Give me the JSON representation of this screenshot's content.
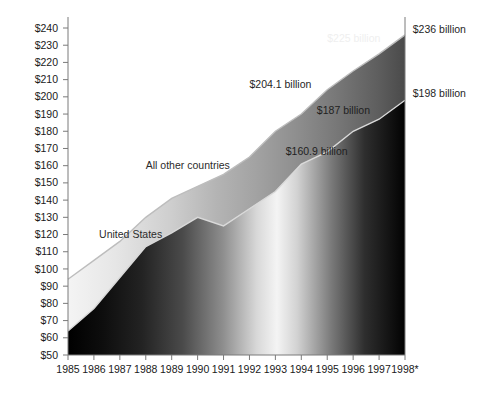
{
  "chart_data": {
    "type": "area",
    "title": "",
    "subtitle": "",
    "xlabel": "",
    "ylabel": "",
    "stacked": true,
    "grid": false,
    "legend_position": "inline-annotation",
    "x": [
      1985,
      1986,
      1987,
      1988,
      1989,
      1990,
      1991,
      1992,
      1993,
      1994,
      1995,
      1996,
      1997,
      1998
    ],
    "categories": [
      "1985",
      "1986",
      "1987",
      "1988",
      "1989",
      "1990",
      "1991",
      "1992",
      "1993",
      "1994",
      "1995",
      "1996",
      "1997",
      "1998*"
    ],
    "xlim": [
      1985,
      1998
    ],
    "ylim": [
      50,
      240
    ],
    "y_ticks": [
      50,
      60,
      70,
      80,
      90,
      100,
      110,
      120,
      130,
      140,
      150,
      160,
      170,
      180,
      190,
      200,
      210,
      220,
      230,
      240
    ],
    "y_tick_labels": [
      "$50",
      "$60",
      "$70",
      "$80",
      "$90",
      "$100",
      "$110",
      "$120",
      "$130",
      "$140",
      "$150",
      "$160",
      "$170",
      "$180",
      "$190",
      "$200",
      "$210",
      "$220",
      "$230",
      "$240"
    ],
    "series": [
      {
        "name": "United States",
        "stack_order": 1,
        "values": [
          64,
          77,
          95,
          113,
          121,
          130,
          125,
          135,
          145,
          160.9,
          168,
          180,
          187,
          198
        ]
      },
      {
        "name": "All other countries",
        "stack_order": 2,
        "cumulative_values": [
          94,
          105,
          116,
          130,
          141,
          148,
          155,
          165,
          180,
          190,
          204.1,
          215,
          225,
          236
        ]
      }
    ],
    "annotations": [
      {
        "id": "series-label-us",
        "text": "United States",
        "x_value": 1986.2,
        "y_value": 118
      },
      {
        "id": "series-label-other",
        "text": "All other countries",
        "x_value": 1988.0,
        "y_value": 158
      },
      {
        "id": "value-160-9",
        "text": "$160.9 billion",
        "x_value": 1993.4,
        "y_value": 166
      },
      {
        "id": "value-187",
        "text": "$187 billion",
        "x_value": 1994.6,
        "y_value": 190
      },
      {
        "id": "value-204-1",
        "text": "$204.1 billion",
        "x_value": 1992.0,
        "y_value": 205
      },
      {
        "id": "value-225",
        "text": "$225 billion",
        "x_value": 1995.0,
        "y_value": 232
      },
      {
        "id": "value-236",
        "text": "$236 billion",
        "x_value": 1998.3,
        "y_value": 237
      },
      {
        "id": "value-198",
        "text": "$198 billion",
        "x_value": 1998.3,
        "y_value": 200
      }
    ]
  },
  "axes": {
    "y_axis_name": "dollars-billions",
    "x_axis_name": "year"
  },
  "colors": {
    "background": "#ffffff",
    "axis": "#7a7a7a",
    "text": "#1a1a1a",
    "us_area_dark": "#0a0a0a",
    "us_area_light": "#f6f6f6",
    "other_area_dark": "#3d3d3d",
    "other_area_light": "#e2e2e2",
    "boundary_line": "#cfcfcf",
    "total_line": "#111111"
  }
}
